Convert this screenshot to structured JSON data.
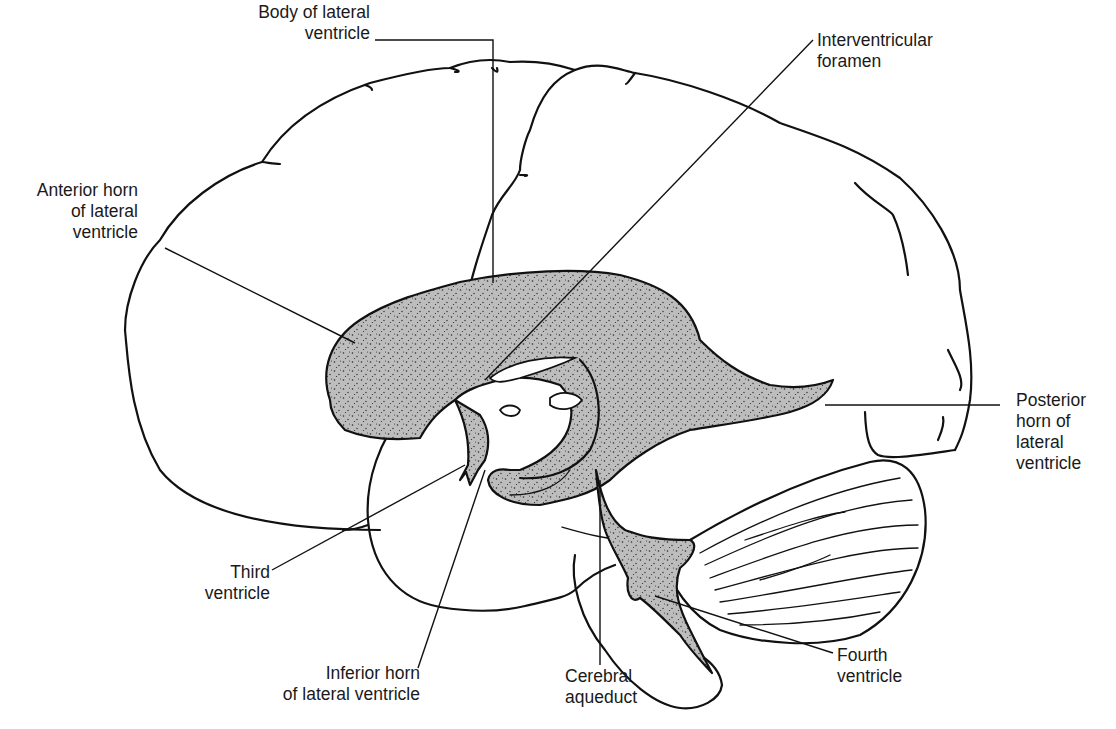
{
  "figure": {
    "colors": {
      "line": "#111111",
      "ventricle_fill": "#bdbdbd",
      "stipple": "#2a2a2a",
      "background": "#ffffff"
    }
  },
  "labels": {
    "body_lateral": {
      "line1": "Body of lateral",
      "line2": "ventricle"
    },
    "interventricular": {
      "line1": "Interventricular",
      "line2": "foramen"
    },
    "anterior_horn": {
      "line1": "Anterior horn",
      "line2": "of lateral",
      "line3": "ventricle"
    },
    "posterior_horn": {
      "line1": "Posterior",
      "line2": "horn of",
      "line3": "lateral",
      "line4": "ventricle"
    },
    "third_ventricle": {
      "line1": "Third",
      "line2": "ventricle"
    },
    "inferior_horn": {
      "line1": "Inferior horn",
      "line2": "of lateral ventricle"
    },
    "cerebral_aqueduct": {
      "line1": "Cerebral",
      "line2": "aqueduct"
    },
    "fourth_ventricle": {
      "line1": "Fourth",
      "line2": "ventricle"
    }
  }
}
